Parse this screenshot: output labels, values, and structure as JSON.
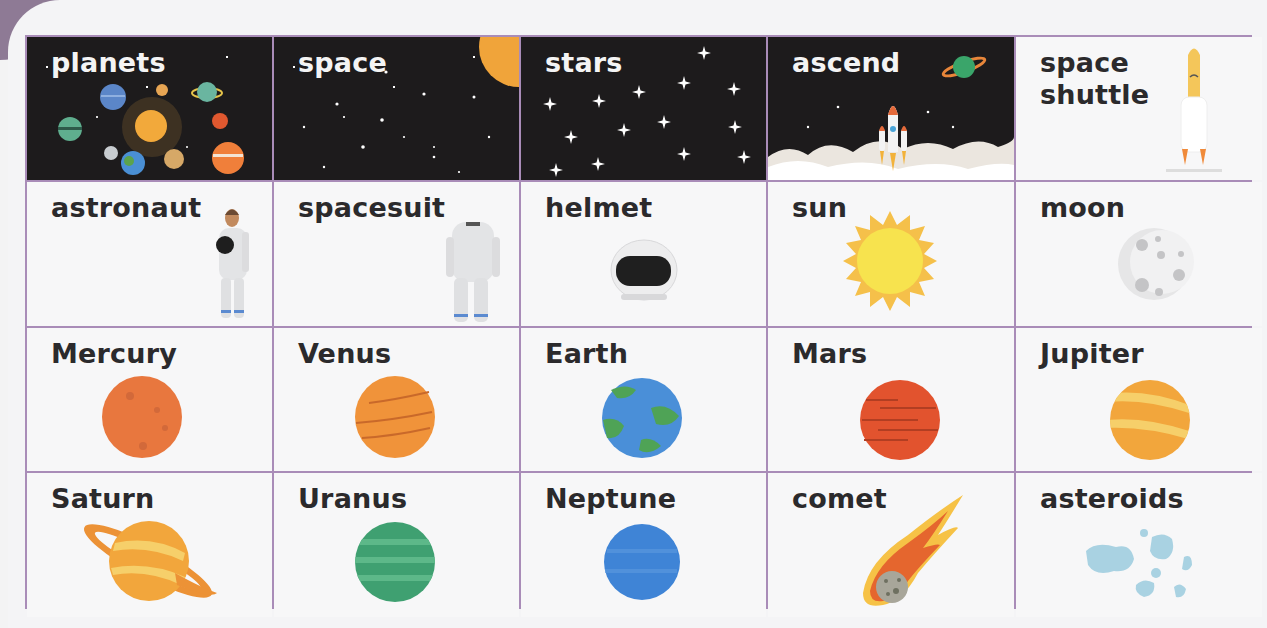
{
  "colors": {
    "grid_border": "#a98cb8",
    "dark_cell": "#1d1b1c",
    "light_cell": "#f7f7f8",
    "label_dark": "#2b2a2c",
    "label_light": "#f4f4f4"
  },
  "cards": [
    {
      "label": "planets",
      "icon": "solar-system-icon",
      "theme": "dark"
    },
    {
      "label": "space",
      "icon": "starfield-icon",
      "theme": "dark"
    },
    {
      "label": "stars",
      "icon": "sparkle-stars-icon",
      "theme": "dark"
    },
    {
      "label": "ascend",
      "icon": "rocket-launch-icon",
      "theme": "dark"
    },
    {
      "label": "space\nshuttle",
      "icon": "space-shuttle-icon",
      "theme": "light"
    },
    {
      "label": "astronaut",
      "icon": "astronaut-icon",
      "theme": "light"
    },
    {
      "label": "spacesuit",
      "icon": "spacesuit-icon",
      "theme": "light"
    },
    {
      "label": "helmet",
      "icon": "helmet-icon",
      "theme": "light"
    },
    {
      "label": "sun",
      "icon": "sun-icon",
      "theme": "light"
    },
    {
      "label": "moon",
      "icon": "moon-icon",
      "theme": "light"
    },
    {
      "label": "Mercury",
      "icon": "mercury-icon",
      "theme": "light"
    },
    {
      "label": "Venus",
      "icon": "venus-icon",
      "theme": "light"
    },
    {
      "label": "Earth",
      "icon": "earth-icon",
      "theme": "light"
    },
    {
      "label": "Mars",
      "icon": "mars-icon",
      "theme": "light"
    },
    {
      "label": "Jupiter",
      "icon": "jupiter-icon",
      "theme": "light"
    },
    {
      "label": "Saturn",
      "icon": "saturn-icon",
      "theme": "light"
    },
    {
      "label": "Uranus",
      "icon": "uranus-icon",
      "theme": "light"
    },
    {
      "label": "Neptune",
      "icon": "neptune-icon",
      "theme": "light"
    },
    {
      "label": "comet",
      "icon": "comet-icon",
      "theme": "light"
    },
    {
      "label": "asteroids",
      "icon": "asteroids-icon",
      "theme": "light"
    }
  ]
}
